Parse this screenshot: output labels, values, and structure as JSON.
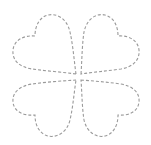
{
  "figure": {
    "background_color": "#ffffff",
    "stroke_color": "#9a9a9a",
    "stroke_style": "dashed",
    "dash_pattern": "3 2",
    "leaves": [
      {
        "name": "top-left-heart"
      },
      {
        "name": "top-right-heart"
      },
      {
        "name": "bottom-left-heart"
      },
      {
        "name": "bottom-right-heart"
      }
    ]
  }
}
